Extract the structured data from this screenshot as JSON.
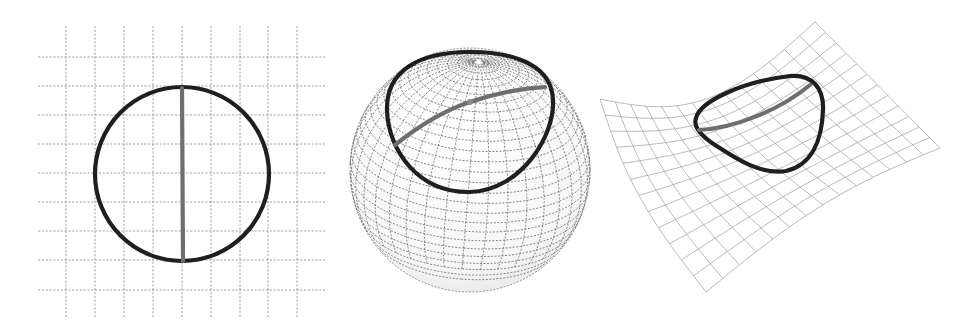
{
  "figure": {
    "panels": [
      {
        "name": "flat-plane",
        "surface": "plane",
        "grid": "dashed square grid",
        "curve": "circle",
        "chord": "vertical diameter"
      },
      {
        "name": "sphere",
        "surface": "sphere",
        "grid": "dashed latitude/longitude mesh",
        "curve": "circle around pole",
        "chord": "arc through pole"
      },
      {
        "name": "saddle",
        "surface": "hyperbolic saddle",
        "grid": "solid curvilinear mesh",
        "curve": "closed loop",
        "chord": "curved arc"
      }
    ],
    "colors": {
      "background": "#ffffff",
      "loop": "#1f1f1f",
      "chord": "#6e6e6e",
      "grid": "#8a8a8a",
      "sphere_grid": "#6a6a6a",
      "saddle_grid": "#a8a8a8"
    }
  }
}
